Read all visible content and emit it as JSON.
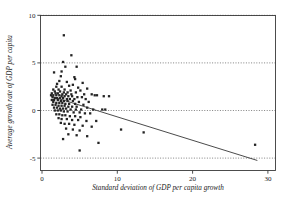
{
  "chart_data": {
    "type": "scatter",
    "title": "",
    "xlabel": "Standard deviation of GDP per capita growth",
    "ylabel": "Average growth rate of GDP per capita",
    "xlim": [
      0,
      31
    ],
    "ylim": [
      -5.8,
      10
    ],
    "xticks": [
      0,
      10,
      20,
      30
    ],
    "xticklabels": [
      "0",
      "10",
      "20",
      "30"
    ],
    "yticks": [
      -5,
      0,
      5,
      10
    ],
    "yticklabels": [
      "-5",
      "0",
      "5",
      "10"
    ],
    "grid": "horizontal-dotted",
    "legend": "none",
    "marker_color": "#242424",
    "line_color": "#2b2b2b",
    "frame_color": "#3a3a3a",
    "series": [
      {
        "name": "Countries",
        "marker": "filled-square",
        "points": [
          [
            2.9,
            7.9
          ],
          [
            3.9,
            5.8
          ],
          [
            2.8,
            5.1
          ],
          [
            3.1,
            4.6
          ],
          [
            4.6,
            4.6
          ],
          [
            2.6,
            4.1
          ],
          [
            1.6,
            4.0
          ],
          [
            2.5,
            3.6
          ],
          [
            4.3,
            3.5
          ],
          [
            4.4,
            3.3
          ],
          [
            2.3,
            3.1
          ],
          [
            3.3,
            3.0
          ],
          [
            5.4,
            2.9
          ],
          [
            2.0,
            2.8
          ],
          [
            4.1,
            2.7
          ],
          [
            3.6,
            2.6
          ],
          [
            1.9,
            2.5
          ],
          [
            2.6,
            2.5
          ],
          [
            4.8,
            2.4
          ],
          [
            6.0,
            2.3
          ],
          [
            1.5,
            2.2
          ],
          [
            2.2,
            2.2
          ],
          [
            3.0,
            2.2
          ],
          [
            3.8,
            2.1
          ],
          [
            5.1,
            2.1
          ],
          [
            1.7,
            2.0
          ],
          [
            2.4,
            2.0
          ],
          [
            2.9,
            1.9
          ],
          [
            3.4,
            1.9
          ],
          [
            4.5,
            1.9
          ],
          [
            1.3,
            1.8
          ],
          [
            1.8,
            1.8
          ],
          [
            2.1,
            1.8
          ],
          [
            2.7,
            1.7
          ],
          [
            3.2,
            1.7
          ],
          [
            3.9,
            1.7
          ],
          [
            5.6,
            1.7
          ],
          [
            6.6,
            1.7
          ],
          [
            7.0,
            1.6
          ],
          [
            7.3,
            1.6
          ],
          [
            8.2,
            1.5
          ],
          [
            8.9,
            1.5
          ],
          [
            1.2,
            1.6
          ],
          [
            1.5,
            1.6
          ],
          [
            1.9,
            1.6
          ],
          [
            2.3,
            1.6
          ],
          [
            2.6,
            1.5
          ],
          [
            3.0,
            1.5
          ],
          [
            3.5,
            1.5
          ],
          [
            4.0,
            1.5
          ],
          [
            4.7,
            1.4
          ],
          [
            5.3,
            1.4
          ],
          [
            1.4,
            1.4
          ],
          [
            1.7,
            1.3
          ],
          [
            2.0,
            1.3
          ],
          [
            2.4,
            1.3
          ],
          [
            2.8,
            1.3
          ],
          [
            3.3,
            1.2
          ],
          [
            3.7,
            1.2
          ],
          [
            4.3,
            1.2
          ],
          [
            5.8,
            1.2
          ],
          [
            1.3,
            1.1
          ],
          [
            1.6,
            1.1
          ],
          [
            2.1,
            1.1
          ],
          [
            2.5,
            1.0
          ],
          [
            2.9,
            1.0
          ],
          [
            3.4,
            1.0
          ],
          [
            4.1,
            1.0
          ],
          [
            4.9,
            0.9
          ],
          [
            6.2,
            0.9
          ],
          [
            1.5,
            0.9
          ],
          [
            1.9,
            0.8
          ],
          [
            2.3,
            0.8
          ],
          [
            2.7,
            0.8
          ],
          [
            3.1,
            0.7
          ],
          [
            3.6,
            0.7
          ],
          [
            4.4,
            0.7
          ],
          [
            5.5,
            0.6
          ],
          [
            1.4,
            0.6
          ],
          [
            1.8,
            0.6
          ],
          [
            2.2,
            0.5
          ],
          [
            2.6,
            0.5
          ],
          [
            3.0,
            0.5
          ],
          [
            3.5,
            0.4
          ],
          [
            4.0,
            0.4
          ],
          [
            4.6,
            0.4
          ],
          [
            6.0,
            0.3
          ],
          [
            1.6,
            0.3
          ],
          [
            2.0,
            0.3
          ],
          [
            2.4,
            0.2
          ],
          [
            2.8,
            0.2
          ],
          [
            3.2,
            0.2
          ],
          [
            3.8,
            0.1
          ],
          [
            4.5,
            0.1
          ],
          [
            5.2,
            0.1
          ],
          [
            6.8,
            0.1
          ],
          [
            8.0,
            0.1
          ],
          [
            8.4,
            0.1
          ],
          [
            1.7,
            0.0
          ],
          [
            2.1,
            0.0
          ],
          [
            2.5,
            0.0
          ],
          [
            2.9,
            -0.1
          ],
          [
            3.4,
            -0.1
          ],
          [
            4.2,
            -0.2
          ],
          [
            5.0,
            -0.2
          ],
          [
            5.7,
            -0.3
          ],
          [
            6.4,
            -0.3
          ],
          [
            1.9,
            -0.4
          ],
          [
            2.3,
            -0.4
          ],
          [
            2.7,
            -0.5
          ],
          [
            3.1,
            -0.5
          ],
          [
            3.7,
            -0.6
          ],
          [
            4.4,
            -0.6
          ],
          [
            5.1,
            -0.7
          ],
          [
            2.2,
            -0.8
          ],
          [
            2.6,
            -0.9
          ],
          [
            3.3,
            -0.9
          ],
          [
            4.0,
            -1.0
          ],
          [
            4.8,
            -1.0
          ],
          [
            5.9,
            -1.1
          ],
          [
            7.2,
            -1.1
          ],
          [
            2.5,
            -1.3
          ],
          [
            3.0,
            -1.4
          ],
          [
            3.6,
            -1.4
          ],
          [
            4.3,
            -1.5
          ],
          [
            5.4,
            -1.6
          ],
          [
            6.6,
            -1.7
          ],
          [
            3.2,
            -1.9
          ],
          [
            4.1,
            -2.0
          ],
          [
            5.0,
            -2.1
          ],
          [
            10.5,
            -2.0
          ],
          [
            13.5,
            -2.3
          ],
          [
            3.5,
            -2.5
          ],
          [
            4.6,
            -2.6
          ],
          [
            6.0,
            -2.7
          ],
          [
            7.5,
            -3.4
          ],
          [
            2.8,
            -3.0
          ],
          [
            5.0,
            -4.2
          ],
          [
            28.3,
            -3.6
          ]
        ]
      }
    ],
    "fit_line": {
      "name": "linear-fit",
      "x_start": 1.2,
      "y_start": 1.5,
      "x_end": 28.6,
      "y_end": -5.25
    }
  }
}
